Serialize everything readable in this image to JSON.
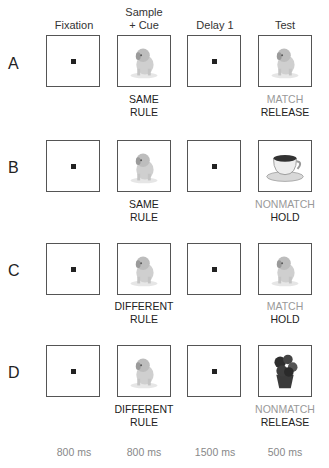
{
  "columns": [
    {
      "title_line1": "",
      "title_line2": "Fixation",
      "duration": "800 ms"
    },
    {
      "title_line1": "Sample",
      "title_line2": "+ Cue",
      "duration": "800 ms"
    },
    {
      "title_line1": "",
      "title_line2": "Delay 1",
      "duration": "1500 ms"
    },
    {
      "title_line1": "",
      "title_line2": "Test",
      "duration": "500 ms"
    }
  ],
  "rows": [
    {
      "label": "A",
      "sample_image": "puppy",
      "test_image": "puppy",
      "cue_line1": "SAME",
      "cue_line2": "RULE",
      "test_line1": "MATCH",
      "test_line2": "RELEASE"
    },
    {
      "label": "B",
      "sample_image": "puppy",
      "test_image": "teacup",
      "cue_line1": "SAME",
      "cue_line2": "RULE",
      "test_line1": "NONMATCH",
      "test_line2": "HOLD"
    },
    {
      "label": "C",
      "sample_image": "puppy",
      "test_image": "puppy",
      "cue_line1": "DIFFERENT",
      "cue_line2": "RULE",
      "test_line1": "MATCH",
      "test_line2": "HOLD"
    },
    {
      "label": "D",
      "sample_image": "puppy",
      "test_image": "potted-flower",
      "cue_line1": "DIFFERENT",
      "cue_line2": "RULE",
      "test_line1": "NONMATCH",
      "test_line2": "RELEASE"
    }
  ]
}
